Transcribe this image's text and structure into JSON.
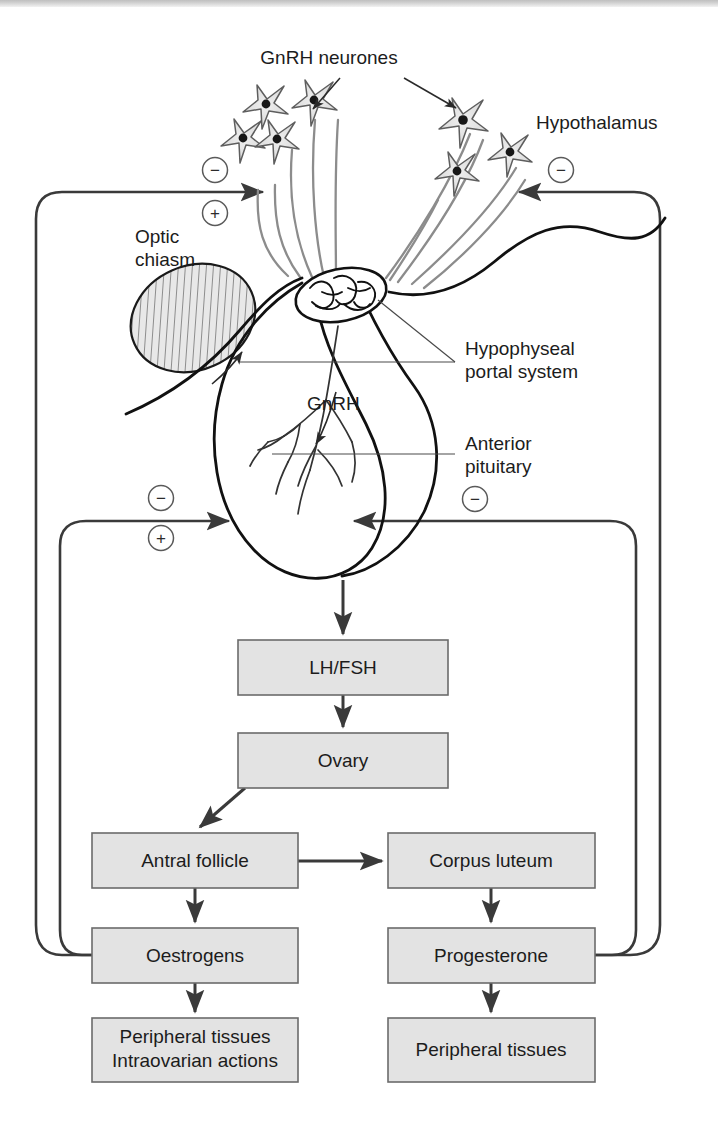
{
  "figure": {
    "background_color": "#ffffff",
    "box_fill_color": "#e3e3e3",
    "box_stroke_color": "#6b6b6b",
    "line_color": "#3a3a3a",
    "anatomy_stroke_color": "#1a1a1a",
    "neurone_fill_color": "#e0e0e0"
  },
  "anatomy_labels": [
    {
      "id": "gnrh-neurones",
      "text": "GnRH neurones",
      "x": 329,
      "y": 64
    },
    {
      "id": "hypothalamus",
      "text": "Hypothalamus",
      "x": 536,
      "y": 129
    },
    {
      "id": "optic-chiasm-line1",
      "text": "Optic",
      "x": 135,
      "y": 243
    },
    {
      "id": "optic-chiasm-line2",
      "text": "chiasm",
      "x": 135,
      "y": 266
    },
    {
      "id": "hypophyseal-portal-line1",
      "text": "Hypophyseal",
      "x": 465,
      "y": 355
    },
    {
      "id": "hypophyseal-portal-line2",
      "text": "portal system",
      "x": 465,
      "y": 378
    },
    {
      "id": "gnrh-arrow-label",
      "text": "GnRH",
      "x": 307,
      "y": 410
    },
    {
      "id": "anterior-pituitary-line1",
      "text": "Anterior",
      "x": 465,
      "y": 450
    },
    {
      "id": "anterior-pituitary-line2",
      "text": "pituitary",
      "x": 465,
      "y": 473
    }
  ],
  "flow_boxes": [
    {
      "id": "lh-fsh",
      "label": "LH/FSH",
      "x": 238,
      "y": 640,
      "w": 210,
      "h": 55,
      "lines": [
        "LH/FSH"
      ]
    },
    {
      "id": "ovary",
      "label": "Ovary",
      "x": 238,
      "y": 733,
      "w": 210,
      "h": 55,
      "lines": [
        "Ovary"
      ]
    },
    {
      "id": "antral-follicle",
      "label": "Antral follicle",
      "x": 92,
      "y": 833,
      "w": 206,
      "h": 55,
      "lines": [
        "Antral follicle"
      ]
    },
    {
      "id": "corpus-luteum",
      "label": "Corpus luteum",
      "x": 388,
      "y": 833,
      "w": 207,
      "h": 55,
      "lines": [
        "Corpus luteum"
      ]
    },
    {
      "id": "oestrogens",
      "label": "Oestrogens",
      "x": 92,
      "y": 928,
      "w": 206,
      "h": 55,
      "lines": [
        "Oestrogens"
      ]
    },
    {
      "id": "progesterone",
      "label": "Progesterone",
      "x": 388,
      "y": 928,
      "w": 207,
      "h": 55,
      "lines": [
        "Progesterone"
      ]
    },
    {
      "id": "peripheral-tissues-intraovarian",
      "label": "Peripheral tissues / Intraovarian actions",
      "x": 92,
      "y": 1018,
      "w": 206,
      "h": 64,
      "lines": [
        "Peripheral tissues",
        "Intraovarian actions"
      ]
    },
    {
      "id": "peripheral-tissues",
      "label": "Peripheral tissues",
      "x": 388,
      "y": 1018,
      "w": 207,
      "h": 64,
      "lines": [
        "Peripheral tissues"
      ]
    }
  ],
  "feedback_signs": [
    {
      "id": "sign-left-upper-negative",
      "symbol": "−",
      "x": 215,
      "y": 170,
      "target": "hypothalamus"
    },
    {
      "id": "sign-left-upper-positive",
      "symbol": "+",
      "x": 215,
      "y": 213,
      "target": "hypothalamus"
    },
    {
      "id": "sign-right-upper-negative",
      "symbol": "−",
      "x": 561,
      "y": 170,
      "target": "hypothalamus"
    },
    {
      "id": "sign-left-lower-negative",
      "symbol": "−",
      "x": 161,
      "y": 498,
      "target": "anterior-pituitary"
    },
    {
      "id": "sign-left-lower-positive",
      "symbol": "+",
      "x": 161,
      "y": 538,
      "target": "anterior-pituitary"
    },
    {
      "id": "sign-right-lower-negative",
      "symbol": "−",
      "x": 475,
      "y": 499,
      "target": "anterior-pituitary"
    }
  ],
  "flow_arrows": [
    {
      "id": "arrow-pituitary-to-lhfsh",
      "from": "anterior-pituitary",
      "to": "lh-fsh"
    },
    {
      "id": "arrow-lhfsh-to-ovary",
      "from": "lh-fsh",
      "to": "ovary"
    },
    {
      "id": "arrow-ovary-to-antral-follicle",
      "from": "ovary",
      "to": "antral-follicle"
    },
    {
      "id": "arrow-antral-to-corpus-luteum",
      "from": "antral-follicle",
      "to": "corpus-luteum"
    },
    {
      "id": "arrow-antral-to-oestrogens",
      "from": "antral-follicle",
      "to": "oestrogens"
    },
    {
      "id": "arrow-corpus-to-progesterone",
      "from": "corpus-luteum",
      "to": "progesterone"
    },
    {
      "id": "arrow-oestrogens-to-peripheral",
      "from": "oestrogens",
      "to": "peripheral-tissues-intraovarian"
    },
    {
      "id": "arrow-progesterone-to-peripheral",
      "from": "progesterone",
      "to": "peripheral-tissues"
    }
  ],
  "feedback_loops": [
    {
      "id": "loop-oestrogens-to-hypothalamus",
      "source": "oestrogens",
      "target": "hypothalamus",
      "side": "left",
      "signs": [
        "−",
        "+"
      ]
    },
    {
      "id": "loop-oestrogens-to-pituitary",
      "source": "oestrogens",
      "target": "anterior-pituitary",
      "side": "left",
      "signs": [
        "−",
        "+"
      ]
    },
    {
      "id": "loop-progesterone-to-hypothalamus",
      "source": "progesterone",
      "target": "hypothalamus",
      "side": "right",
      "signs": [
        "−"
      ]
    },
    {
      "id": "loop-progesterone-to-pituitary",
      "source": "progesterone",
      "target": "anterior-pituitary",
      "side": "right",
      "signs": [
        "−"
      ]
    }
  ],
  "neurones": {
    "count": 7,
    "description": "GnRH neurone cell bodies with axons projecting to the median eminence"
  }
}
